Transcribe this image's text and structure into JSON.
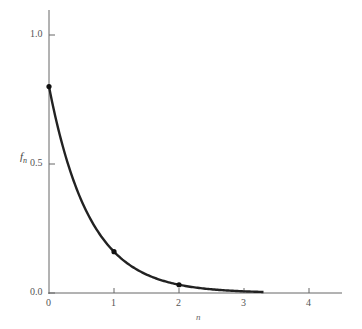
{
  "chart_data": {
    "type": "line",
    "title": "",
    "xlabel": "n",
    "ylabel": "f_n",
    "x": [
      0,
      1,
      2,
      3
    ],
    "series": [
      {
        "name": "f_n",
        "values": [
          0.8,
          0.16,
          0.032,
          0.0064
        ]
      }
    ],
    "markers": [
      {
        "x": 0,
        "y": 0.8
      },
      {
        "x": 1,
        "y": 0.16
      },
      {
        "x": 2,
        "y": 0.032
      }
    ],
    "xticks": [
      "0",
      "1",
      "2",
      "3",
      "4"
    ],
    "yticks": [
      "0.0",
      "0.5",
      "1.0"
    ],
    "xlim": [
      0,
      4.5
    ],
    "ylim": [
      0,
      1.1
    ],
    "grid": false,
    "legend": null
  },
  "axes": {
    "ylabel_main": "f",
    "ylabel_sub": "n",
    "xlabel": "n"
  }
}
